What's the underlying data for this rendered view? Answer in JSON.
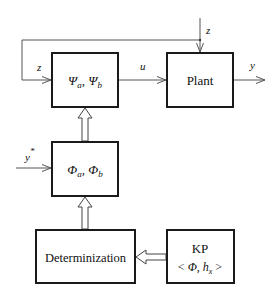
{
  "diagram": {
    "blocks": {
      "controller": {
        "label": "Ψa, Ψb",
        "main": "Ψ",
        "sub_a": "a",
        "sep": ", ",
        "main2": "Ψ",
        "sub_b": "b"
      },
      "plant": {
        "label": "Plant"
      },
      "estimator": {
        "label": "Φa, Φb",
        "main": "Φ",
        "sub_a": "a",
        "sep": ", ",
        "main2": "Φ",
        "sub_b": "b"
      },
      "determinization": {
        "label": "Determinization"
      },
      "kp": {
        "line1": "KP",
        "line2_open": "< ",
        "line2_phi": "Φ",
        "line2_sep": ", ",
        "line2_h": "h",
        "line2_sub": "x",
        "line2_close": " >"
      }
    },
    "signals": {
      "z_top": "z",
      "z_feedback": "z",
      "u": "u",
      "y": "y",
      "y_star": "y",
      "y_star_sup": "*"
    },
    "colors": {
      "box_stroke": "#1a1a1a",
      "line": "#555555",
      "background": "#ffffff"
    }
  }
}
